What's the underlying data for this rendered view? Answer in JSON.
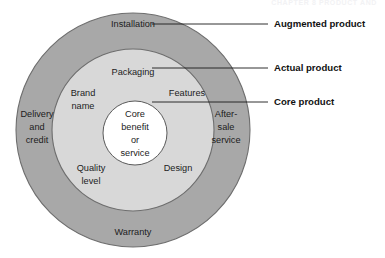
{
  "page": {
    "header_text": "CHAPTER 8   PRODUCT AND"
  },
  "diagram": {
    "colors": {
      "augmented_ring_fill": "#a8a8a8",
      "actual_ring_fill": "#d8d8d8",
      "core_circle_fill": "#ffffff",
      "ring_outline": "#6e6e6e",
      "background": "#ffffff",
      "text": "#1c1c1c",
      "callout_text": "#111111",
      "leader_line": "#1a1a1a"
    },
    "core": {
      "lines": [
        "Core",
        "benefit",
        "or",
        "service"
      ]
    },
    "actual_ring_items": [
      {
        "name": "packaging",
        "lines": [
          "Packaging"
        ]
      },
      {
        "name": "brand-name",
        "lines": [
          "Brand",
          "name"
        ]
      },
      {
        "name": "features",
        "lines": [
          "Features"
        ]
      },
      {
        "name": "quality-level",
        "lines": [
          "Quality",
          "level"
        ]
      },
      {
        "name": "design",
        "lines": [
          "Design"
        ]
      }
    ],
    "augmented_ring_items": [
      {
        "name": "installation",
        "lines": [
          "Installation"
        ]
      },
      {
        "name": "delivery-and-credit",
        "lines": [
          "Delivery",
          "and",
          "credit"
        ]
      },
      {
        "name": "after-sale-service",
        "lines": [
          "After-",
          "sale",
          "service"
        ]
      },
      {
        "name": "warranty",
        "lines": [
          "Warranty"
        ]
      }
    ],
    "callouts": [
      {
        "name": "augmented-product",
        "label": "Augmented product"
      },
      {
        "name": "actual-product",
        "label": "Actual product"
      },
      {
        "name": "core-product",
        "label": "Core product"
      }
    ]
  }
}
